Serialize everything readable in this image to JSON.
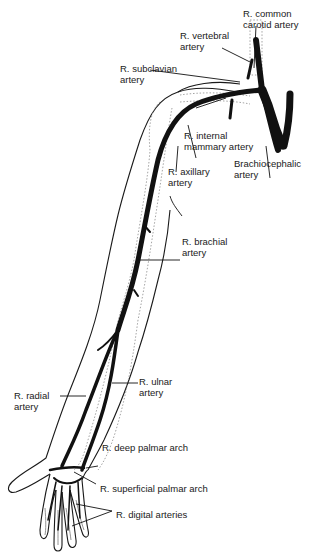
{
  "diagram": {
    "colors": {
      "artery": "#111111",
      "outline": "#1a1a1a",
      "bone_dotted": "#9a9a9a",
      "background": "#ffffff"
    },
    "labels": [
      {
        "id": "common-carotid",
        "line1": "R. common",
        "line2": "carotid artery"
      },
      {
        "id": "vertebral",
        "line1": "R. vertebral",
        "line2": "artery"
      },
      {
        "id": "subclavian",
        "line1": "R. subclavian",
        "line2": "artery"
      },
      {
        "id": "internal-mammary",
        "line1": "R. internal",
        "line2": "mammary artery"
      },
      {
        "id": "brachiocephalic",
        "line1": "Brachiocephalic",
        "line2": "artery"
      },
      {
        "id": "axillary",
        "line1": "R. axillary",
        "line2": "artery"
      },
      {
        "id": "brachial",
        "line1": "R. brachial",
        "line2": "artery"
      },
      {
        "id": "ulnar",
        "line1": "R. ulnar",
        "line2": "artery"
      },
      {
        "id": "radial",
        "line1": "R. radial",
        "line2": "artery"
      },
      {
        "id": "deep-palmar",
        "line1": "R. deep palmar arch",
        "line2": ""
      },
      {
        "id": "superficial-palmar",
        "line1": "R. superficial palmar arch",
        "line2": ""
      },
      {
        "id": "digital",
        "line1": "R. digital arteries",
        "line2": ""
      }
    ]
  }
}
